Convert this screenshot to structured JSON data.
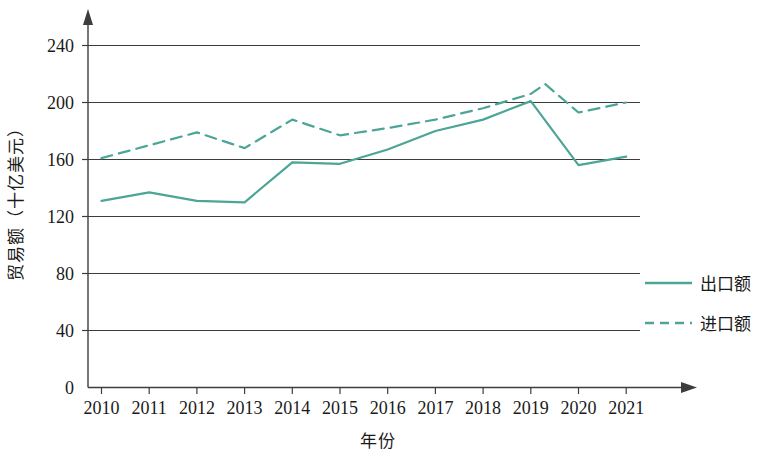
{
  "chart_data": {
    "type": "line",
    "title": "",
    "xlabel": "年份",
    "ylabel": "贸易额（十亿美元）",
    "categories": [
      "2010",
      "2011",
      "2012",
      "2013",
      "2014",
      "2015",
      "2016",
      "2017",
      "2018",
      "2019",
      "2020",
      "2021"
    ],
    "x_tick_labels": [
      "2010",
      "2011",
      "2012",
      "2013",
      "2014",
      "2015",
      "2016",
      "2017",
      "2018",
      "2019",
      "2020",
      "2021"
    ],
    "y_tick_labels": [
      "0",
      "40",
      "80",
      "120",
      "160",
      "200",
      "240"
    ],
    "y_ticks": [
      0,
      40,
      80,
      120,
      160,
      200,
      240
    ],
    "ylim": [
      0,
      250
    ],
    "grid": "horizontal",
    "legend_position": "right",
    "series": [
      {
        "name": "出口额",
        "style": "solid",
        "color": "#4ca596",
        "values": [
          131,
          137,
          131,
          130,
          158,
          157,
          167,
          180,
          188,
          201,
          156,
          162
        ]
      },
      {
        "name": "进口额",
        "style": "dashed",
        "color": "#4ca596",
        "values": [
          161,
          170,
          179,
          168,
          188,
          177,
          182,
          188,
          196,
          206,
          193,
          200
        ]
      }
    ],
    "annotations": [
      {
        "label": "进口额 peak",
        "x": "2019.3",
        "y": 213
      }
    ]
  },
  "legend": {
    "items": [
      {
        "label": "出口额",
        "style": "solid",
        "color": "#4ca596"
      },
      {
        "label": "进口额",
        "style": "dashed",
        "color": "#4ca596"
      }
    ]
  },
  "axes": {
    "y_label": "贸易额（十亿美元）",
    "x_label": "年份"
  }
}
